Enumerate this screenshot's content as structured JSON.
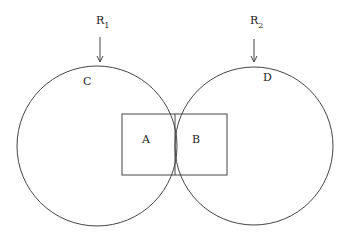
{
  "diagram": {
    "labels": {
      "r1": "R",
      "r1_sub": "1",
      "r2": "R",
      "r2_sub": "2",
      "circle_left": "C",
      "circle_right": "D",
      "rect_left": "A",
      "rect_right": "B"
    },
    "colors": {
      "line": "#444444",
      "text": "#222222",
      "background": "#ffffff"
    }
  }
}
